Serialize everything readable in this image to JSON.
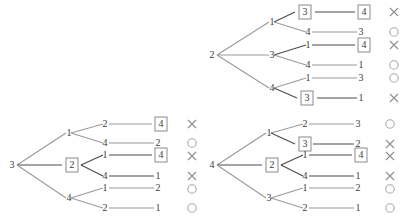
{
  "figure": {
    "kind": "permutation-enumeration-trees",
    "colors": {
      "edge_dark": "#4a4a4a",
      "edge_light": "#9a9a9a",
      "text": "#3b3b3b",
      "box_border": "#8a8a8a",
      "mark_cross": "#8f8f8f",
      "mark_circle": "#a8a8a8",
      "background": "#ffffff"
    },
    "marks": {
      "cross_name": "cross-mark",
      "circle_name": "circle-mark",
      "cross_glyph": "×",
      "circle_glyph": "○"
    }
  },
  "trees": [
    {
      "id": "tree-top-right",
      "root": {
        "label": "2",
        "boxed": false
      },
      "level1": [
        {
          "label": "1",
          "boxed": false
        },
        {
          "label": "3",
          "boxed": false
        },
        {
          "label": "4",
          "boxed": false
        }
      ],
      "level2": [
        {
          "label": "3",
          "boxed": true
        },
        {
          "label": "4",
          "boxed": false
        },
        {
          "label": "1",
          "boxed": false
        },
        {
          "label": "4",
          "boxed": false
        },
        {
          "label": "1",
          "boxed": false
        },
        {
          "label": "3",
          "boxed": true
        }
      ],
      "level3": [
        {
          "label": "4",
          "boxed": true
        },
        {
          "label": "3",
          "boxed": false
        },
        {
          "label": "4",
          "boxed": true
        },
        {
          "label": "1",
          "boxed": false
        },
        {
          "label": "3",
          "boxed": false
        },
        {
          "label": "1",
          "boxed": false
        }
      ],
      "marks": [
        "cross",
        "circle",
        "cross",
        "circle",
        "circle",
        "cross"
      ]
    },
    {
      "id": "tree-bottom-left",
      "root": {
        "label": "3",
        "boxed": false
      },
      "level1": [
        {
          "label": "1",
          "boxed": false
        },
        {
          "label": "2",
          "boxed": true
        },
        {
          "label": "4",
          "boxed": false
        }
      ],
      "level2": [
        {
          "label": "2",
          "boxed": false
        },
        {
          "label": "4",
          "boxed": false
        },
        {
          "label": "1",
          "boxed": false
        },
        {
          "label": "4",
          "boxed": false
        },
        {
          "label": "1",
          "boxed": false
        },
        {
          "label": "2",
          "boxed": false
        }
      ],
      "level3": [
        {
          "label": "4",
          "boxed": true
        },
        {
          "label": "2",
          "boxed": false
        },
        {
          "label": "4",
          "boxed": true
        },
        {
          "label": "1",
          "boxed": false
        },
        {
          "label": "2",
          "boxed": false
        },
        {
          "label": "1",
          "boxed": false
        }
      ],
      "marks": [
        "cross",
        "circle",
        "cross",
        "cross",
        "circle",
        "circle"
      ]
    },
    {
      "id": "tree-bottom-right",
      "root": {
        "label": "4",
        "boxed": false
      },
      "level1": [
        {
          "label": "1",
          "boxed": false
        },
        {
          "label": "2",
          "boxed": true
        },
        {
          "label": "3",
          "boxed": false
        }
      ],
      "level2": [
        {
          "label": "2",
          "boxed": false
        },
        {
          "label": "3",
          "boxed": true
        },
        {
          "label": "1",
          "boxed": false
        },
        {
          "label": "4",
          "boxed": false
        },
        {
          "label": "1",
          "boxed": false
        },
        {
          "label": "2",
          "boxed": false
        }
      ],
      "level3": [
        {
          "label": "3",
          "boxed": false
        },
        {
          "label": "2",
          "boxed": false
        },
        {
          "label": "4",
          "boxed": true
        },
        {
          "label": "1",
          "boxed": false
        },
        {
          "label": "2",
          "boxed": false
        },
        {
          "label": "1",
          "boxed": false
        }
      ],
      "marks": [
        "circle",
        "cross",
        "cross",
        "cross",
        "circle",
        "circle"
      ]
    }
  ]
}
